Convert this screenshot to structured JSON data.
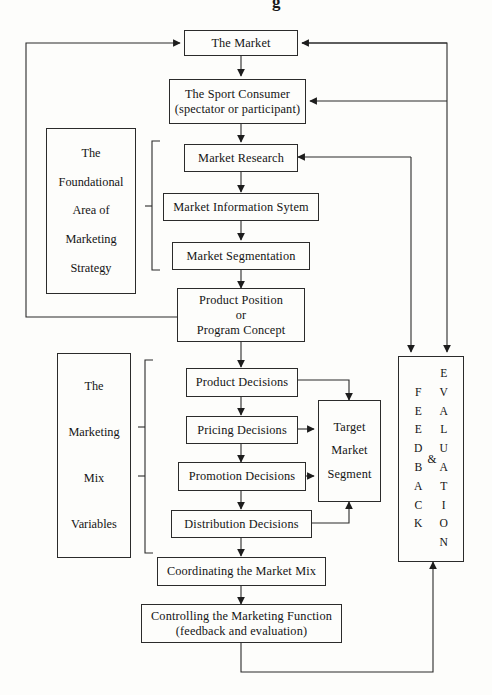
{
  "diagram": {
    "title_fragment": "g",
    "nodes": {
      "market": {
        "label": "The Market"
      },
      "sport_consumer": {
        "line1": "The Sport Consumer",
        "line2": "(spectator or participant)"
      },
      "market_research": {
        "label": "Market Research"
      },
      "market_info_system": {
        "label": "Market Information Sytem"
      },
      "market_segmentation": {
        "label": "Market Segmentation"
      },
      "product_position": {
        "line1": "Product Position",
        "line2": "or",
        "line3": "Program Concept"
      },
      "product_decisions": {
        "label": "Product Decisions"
      },
      "pricing_decisions": {
        "label": "Pricing Decisions"
      },
      "promotion_decisions": {
        "label": "Promotion Decisions"
      },
      "distribution_decisions": {
        "label": "Distribution Decisions"
      },
      "target_market_segment": {
        "line1": "Target",
        "line2": "Market",
        "line3": "Segment"
      },
      "coordinating": {
        "label": "Coordinating the Market Mix"
      },
      "controlling": {
        "line1": "Controlling the Marketing Function",
        "line2": "(feedback and evaluation)"
      }
    },
    "side_panels": {
      "foundational": {
        "line1": "The",
        "line2": "Foundational",
        "line3": "Area of",
        "line4": "Marketing",
        "line5": "Strategy"
      },
      "marketing_mix": {
        "line1": "The",
        "line2": "Marketing",
        "line3": "Mix",
        "line4": "Variables"
      }
    },
    "feedback_panel": {
      "feedback_letters": [
        "F",
        "E",
        "E",
        "D",
        "B",
        "A",
        "C",
        "K"
      ],
      "ampersand": "&",
      "evaluation_letters": [
        "E",
        "V",
        "A",
        "L",
        "U",
        "A",
        "T",
        "I",
        "O",
        "N"
      ]
    },
    "colors": {
      "stroke": "#2b2b2b",
      "background": "#fdfdfb",
      "text": "#141414"
    }
  }
}
